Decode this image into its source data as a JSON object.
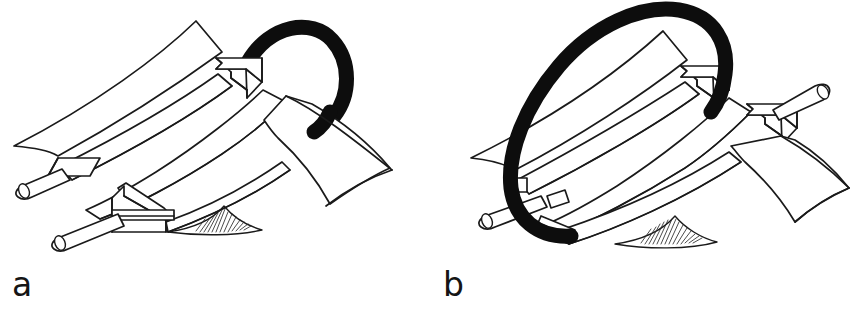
{
  "figure": {
    "background_color": "#ffffff",
    "ink_color": "#1a1a1a",
    "loop_color": "#0d0d0d",
    "width": 858,
    "height": 309,
    "type": "line-art schematic"
  },
  "panels": [
    {
      "id": "a",
      "label": "a",
      "description": "Twisted beta-sheet with two antiparallel-drawn arrow strands and a thick dark crossover loop passing behind the sheet at the upper right; the straight rod axis enters at the lower left and terminates under the left arrow tail.",
      "loop_handedness": "right-handed crossover, loop behind sheet",
      "loop_position": "upper-right",
      "rod_position": "lower-left",
      "arrow_count": 2,
      "shaded_region": "hatched wedge at lower sheet edge"
    },
    {
      "id": "b",
      "label": "b",
      "description": "Twisted beta-sheet with two arrow strands and a thick dark crossover loop encircling the left side of the sheet in front; the straight rod axis passes through the loop and exits at the upper right through the second arrowhead.",
      "loop_handedness": "left-handed crossover, loop in front of sheet",
      "loop_position": "left, encircling",
      "rod_position": "lower-left to upper-right",
      "arrow_count": 2,
      "shaded_region": "hatched wedge at lower sheet edge"
    }
  ],
  "labels": {
    "panel_a": "a",
    "panel_b": "b"
  }
}
